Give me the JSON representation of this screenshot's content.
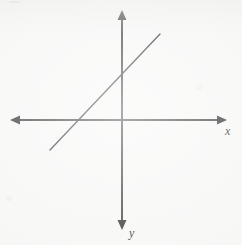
{
  "figure": {
    "name": "coordinate-plane-with-line",
    "background_color": "#f7f7f6",
    "width": 242,
    "height": 245,
    "axis_color": "#4a4a4a",
    "line_color": "#45454a",
    "label_color": "#3c3c3c",
    "axis_stroke_width": 2,
    "line_stroke_width": 1.4
  },
  "labels": {
    "x_axis": "x",
    "y_axis": "y"
  },
  "chart_data": {
    "type": "line",
    "title": "",
    "subtitle": "",
    "xlabel": "x",
    "ylabel": "y",
    "grid": false,
    "legend": "none",
    "annotations": [],
    "axes": {
      "origin_px": [
        122,
        120
      ],
      "x_axis_px": {
        "y": 120,
        "from_x": 10,
        "to_x": 227,
        "arrowheads": [
          "left",
          "right"
        ]
      },
      "y_axis_px": {
        "x": 122,
        "from_y": 10,
        "to_y": 230,
        "arrowheads": [
          "up",
          "down"
        ]
      },
      "y_axis_direction": "downward-positive",
      "xlim": [
        -8.0,
        7.5
      ],
      "ylim": [
        -8.0,
        7.9
      ],
      "tick_labels": []
    },
    "series": [
      {
        "name": "line",
        "kind": "straight-line-segment",
        "endpoints_px": [
          [
            50,
            150
          ],
          [
            160,
            34
          ]
        ],
        "endpoints_data": [
          [
            -2.6,
            -1.07
          ],
          [
            1.36,
            3.07
          ]
        ],
        "slope": 1.05,
        "y_intercept_px": [
          122,
          76
        ],
        "x_intercept_px": [
          78,
          120
        ],
        "y_intercept": 1.57,
        "x_intercept": -1.57,
        "x": [
          -2.6,
          1.36
        ],
        "values": [
          -1.07,
          3.07
        ]
      }
    ]
  }
}
